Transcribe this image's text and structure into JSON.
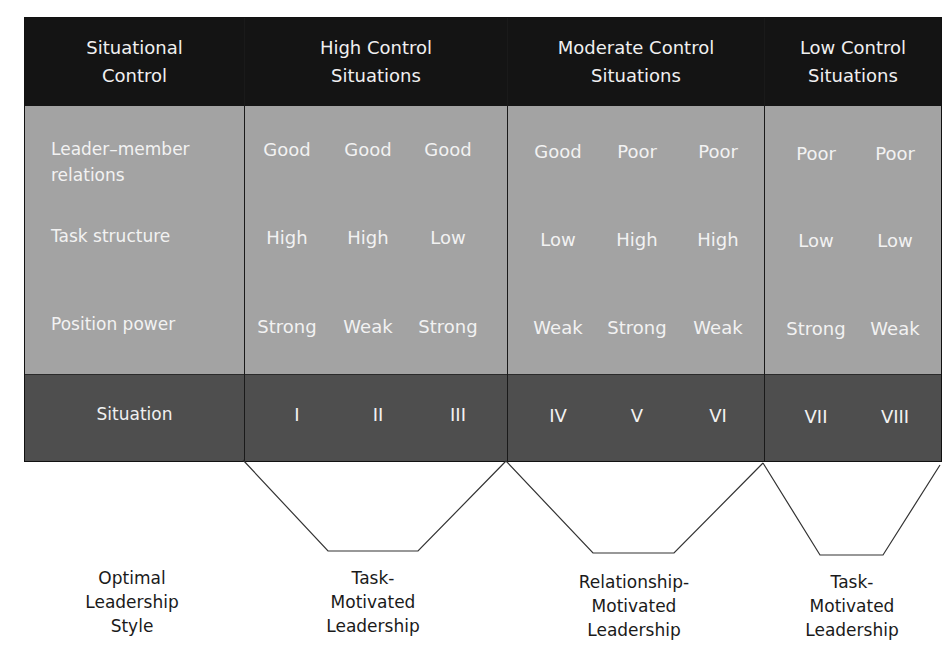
{
  "header": {
    "label_col": "Situational\nControl",
    "groups": [
      {
        "title": "High Control\nSituations"
      },
      {
        "title": "Moderate Control\nSituations"
      },
      {
        "title": "Low Control\nSituations"
      }
    ]
  },
  "rows": {
    "leader_member": {
      "label": "Leader–member\nrelations",
      "values": [
        "Good",
        "Good",
        "Good",
        "Good",
        "Poor",
        "Poor",
        "Poor",
        "Poor"
      ]
    },
    "task_structure": {
      "label": "Task structure",
      "values": [
        "High",
        "High",
        "Low",
        "Low",
        "High",
        "High",
        "Low",
        "Low"
      ]
    },
    "position_power": {
      "label": "Position power",
      "values": [
        "Strong",
        "Weak",
        "Strong",
        "Weak",
        "Strong",
        "Weak",
        "Strong",
        "Weak"
      ]
    },
    "situation": {
      "label": "Situation",
      "values": [
        "I",
        "II",
        "III",
        "IV",
        "V",
        "VI",
        "VII",
        "VIII"
      ]
    }
  },
  "leadership": {
    "row_label": "Optimal\nLeadership\nStyle",
    "styles": [
      {
        "label": "Task-\nMotivated\nLeadership"
      },
      {
        "label": "Relationship-\nMotivated\nLeadership"
      },
      {
        "label": "Task-\nMotivated\nLeadership"
      }
    ]
  },
  "colors": {
    "header_bg": "#141414",
    "body_bg": "#a3a3a3",
    "situation_bg": "#4e4e4e",
    "text_light": "#f2f2f2"
  }
}
